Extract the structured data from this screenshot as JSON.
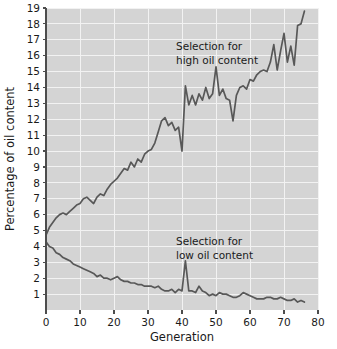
{
  "chart_data": {
    "type": "line",
    "title": "",
    "xlabel": "Generation",
    "ylabel": "Percentage of oil content",
    "xlim": [
      0,
      80
    ],
    "ylim": [
      0,
      19
    ],
    "grid": true,
    "legend_position": "inline-annotations",
    "xticks": [
      0,
      10,
      20,
      30,
      40,
      50,
      60,
      70,
      80
    ],
    "xtick_labels": [
      "0",
      "10",
      "20",
      "30",
      "40",
      "50",
      "60",
      "70",
      "80"
    ],
    "yticks": [
      1,
      2,
      3,
      4,
      5,
      6,
      7,
      8,
      9,
      10,
      11,
      12,
      13,
      14,
      15,
      16,
      17,
      18,
      19
    ],
    "ytick_labels": [
      "1",
      "2",
      "3",
      "4",
      "5",
      "6",
      "7",
      "8",
      "9",
      "10",
      "11",
      "12",
      "13",
      "14",
      "15",
      "16",
      "17",
      "18",
      "19"
    ],
    "annotations": [
      {
        "text_line1": "Selection for",
        "text_line2": "high oil content",
        "x": 45,
        "y": 17
      },
      {
        "text_line1": "Selection for",
        "text_line2": "low oil content",
        "x": 45,
        "y": 4
      }
    ],
    "series": [
      {
        "name": "Selection for high oil content",
        "color": "#585858",
        "x": [
          0,
          1,
          2,
          3,
          4,
          5,
          6,
          7,
          8,
          9,
          10,
          11,
          12,
          13,
          14,
          15,
          16,
          17,
          18,
          19,
          20,
          21,
          22,
          23,
          24,
          25,
          26,
          27,
          28,
          29,
          30,
          31,
          32,
          33,
          34,
          35,
          36,
          37,
          38,
          39,
          40,
          41,
          42,
          43,
          44,
          45,
          46,
          47,
          48,
          49,
          50,
          51,
          52,
          53,
          54,
          55,
          56,
          57,
          58,
          59,
          60,
          61,
          62,
          63,
          64,
          65,
          66,
          67,
          68,
          69,
          70,
          71,
          72,
          73,
          74,
          75,
          76
        ],
        "values": [
          4.7,
          5.2,
          5.5,
          5.8,
          6.0,
          6.1,
          6.0,
          6.2,
          6.4,
          6.6,
          6.7,
          7.0,
          7.1,
          6.9,
          6.7,
          7.1,
          7.3,
          7.2,
          7.6,
          7.9,
          8.1,
          8.3,
          8.6,
          8.9,
          8.8,
          9.3,
          9.0,
          9.5,
          9.3,
          9.8,
          10.0,
          10.1,
          10.5,
          11.2,
          11.9,
          12.1,
          11.6,
          11.8,
          11.3,
          11.5,
          10.0,
          14.1,
          12.9,
          13.5,
          12.9,
          13.6,
          13.2,
          14.0,
          13.3,
          13.6,
          15.3,
          13.5,
          13.9,
          13.3,
          13.2,
          11.9,
          13.5,
          14.0,
          14.1,
          13.9,
          14.5,
          14.4,
          14.8,
          15.0,
          15.1,
          15.0,
          15.6,
          16.7,
          15.1,
          16.3,
          17.4,
          15.6,
          16.6,
          15.4,
          17.9,
          18.0,
          18.8
        ]
      },
      {
        "name": "Selection for low oil content",
        "color": "#585858",
        "x": [
          0,
          1,
          2,
          3,
          4,
          5,
          6,
          7,
          8,
          9,
          10,
          11,
          12,
          13,
          14,
          15,
          16,
          17,
          18,
          19,
          20,
          21,
          22,
          23,
          24,
          25,
          26,
          27,
          28,
          29,
          30,
          31,
          32,
          33,
          34,
          35,
          36,
          37,
          38,
          39,
          40,
          41,
          42,
          43,
          44,
          45,
          46,
          47,
          48,
          49,
          50,
          51,
          52,
          53,
          54,
          55,
          56,
          57,
          58,
          59,
          60,
          61,
          62,
          63,
          64,
          65,
          66,
          67,
          68,
          69,
          70,
          71,
          72,
          73,
          74,
          75,
          76
        ],
        "values": [
          4.3,
          4.0,
          3.9,
          3.6,
          3.5,
          3.3,
          3.2,
          3.1,
          2.9,
          2.8,
          2.7,
          2.6,
          2.5,
          2.4,
          2.3,
          2.1,
          2.2,
          2.0,
          2.0,
          1.9,
          2.0,
          2.1,
          1.9,
          1.8,
          1.8,
          1.7,
          1.7,
          1.6,
          1.6,
          1.5,
          1.5,
          1.5,
          1.4,
          1.5,
          1.3,
          1.2,
          1.2,
          1.3,
          1.1,
          1.3,
          1.2,
          3.1,
          1.2,
          1.2,
          1.1,
          1.5,
          1.2,
          1.1,
          0.9,
          1.0,
          0.9,
          1.1,
          1.0,
          1.0,
          0.9,
          0.8,
          0.8,
          0.9,
          1.1,
          1.0,
          0.9,
          0.8,
          0.7,
          0.7,
          0.7,
          0.8,
          0.8,
          0.7,
          0.7,
          0.8,
          0.7,
          0.6,
          0.6,
          0.7,
          0.5,
          0.6,
          0.5
        ]
      }
    ]
  }
}
